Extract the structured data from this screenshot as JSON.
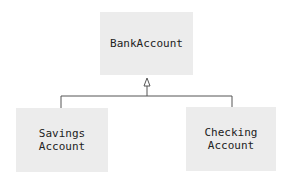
{
  "diagram": {
    "type": "uml-class-inheritance",
    "parent": {
      "label": "BankAccount"
    },
    "children": [
      {
        "line1": "Savings",
        "line2": "Account"
      },
      {
        "line1": "Checking",
        "line2": "Account"
      }
    ],
    "colors": {
      "box_fill": "#ececec",
      "line": "#555555",
      "text": "#222222"
    }
  }
}
